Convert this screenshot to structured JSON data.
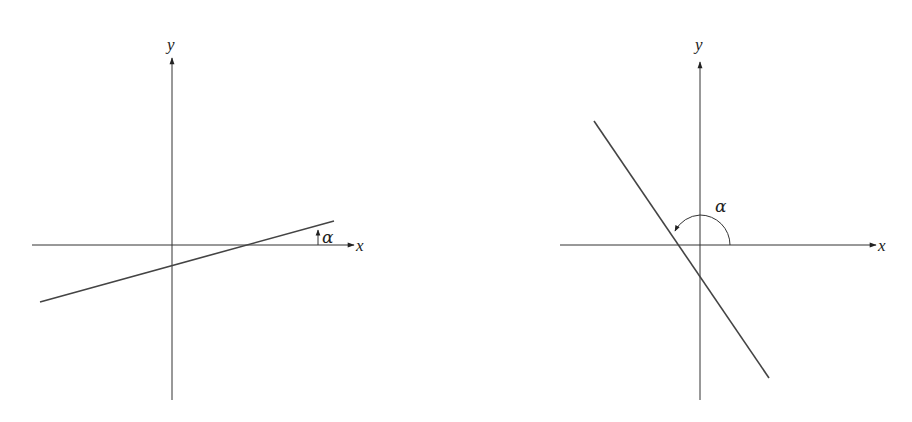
{
  "figures": [
    {
      "id": "left",
      "description": "Line with positive slope; inclination angle alpha is acute, measured from positive x-axis",
      "x_axis_label": "x",
      "y_axis_label": "y",
      "angle_label": "α"
    },
    {
      "id": "right",
      "description": "Line with negative slope; inclination angle alpha is obtuse, measured counterclockwise from positive x-axis",
      "x_axis_label": "x",
      "y_axis_label": "y",
      "angle_label": "α"
    }
  ],
  "colors": {
    "stroke": "#333333",
    "background": "#ffffff"
  }
}
